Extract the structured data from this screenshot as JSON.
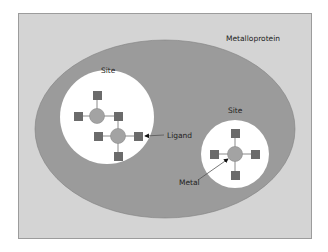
{
  "diagram": {
    "type": "nested-containment",
    "labels": {
      "outer": "Metalloprotein",
      "site_left": "Site",
      "site_right": "Site",
      "ligand": "Ligand",
      "metal": "Metal"
    },
    "colors": {
      "frame_fill": "#d4d4d4",
      "frame_border": "#9c9c9c",
      "protein_fill": "#9b9b9b",
      "site_fill": "#ffffff",
      "metal_fill": "#a3a3a3",
      "ligand_fill": "#6b6b6b",
      "bond_line": "#8a8a8a",
      "text": "#222222"
    },
    "sites": [
      {
        "name": "site-left",
        "metals": 2,
        "ligands_per_metal": 4,
        "shared_ligands": 1
      },
      {
        "name": "site-right",
        "metals": 1,
        "ligands_per_metal": 4
      }
    ]
  }
}
